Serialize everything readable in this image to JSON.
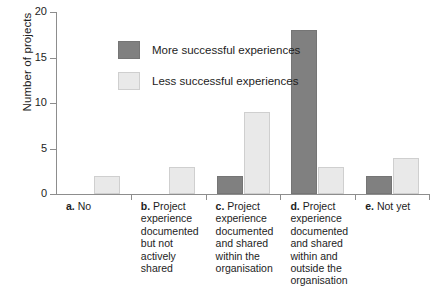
{
  "chart_data": {
    "type": "bar",
    "title": "",
    "xlabel": "",
    "ylabel": "Number of projects",
    "ylim": [
      0,
      20
    ],
    "yticks": [
      "0",
      "5",
      "10",
      "15",
      "20"
    ],
    "grid": false,
    "legend_position": "inside-upper-left",
    "categories": [
      "a. No",
      "b. Project experience documented but not actively shared",
      "c. Project experience documented and shared within the organisation",
      "d. Project experience documented and shared within and outside the organisation",
      "e. Not yet"
    ],
    "category_letters": [
      "a.",
      "b.",
      "c.",
      "d.",
      "e."
    ],
    "category_lines": [
      [
        "No"
      ],
      [
        "Project",
        "experience",
        "documented",
        "but not",
        "actively shared"
      ],
      [
        "Project",
        "experience",
        "documented",
        "and shared",
        "within the",
        "organisation"
      ],
      [
        "Project",
        "experience",
        "documented",
        "and shared",
        "within and",
        "outside the",
        "organisation"
      ],
      [
        "Not yet"
      ]
    ],
    "series": [
      {
        "name": "More successful experiences",
        "color": "#808080",
        "values": [
          0,
          0,
          2,
          18,
          2
        ]
      },
      {
        "name": "Less successful experiences",
        "color": "#e9e9e9",
        "values": [
          2,
          3,
          9,
          3,
          4
        ]
      }
    ]
  },
  "legend": {
    "items": [
      {
        "label": "More successful experiences",
        "swatch": "dark"
      },
      {
        "label": "Less successful experiences",
        "swatch": "light"
      }
    ]
  },
  "axis": {
    "y_title": "Number of projects"
  }
}
